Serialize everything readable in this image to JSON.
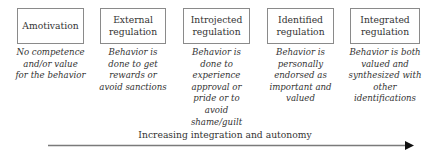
{
  "diagram": {
    "stages": [
      {
        "title_lines": [
          "Amotivation"
        ],
        "description_lines": [
          "No competence",
          "and/or value",
          "for the behavior"
        ]
      },
      {
        "title_lines": [
          "External",
          "regulation"
        ],
        "description_lines": [
          "Behavior is",
          "done to get",
          "rewards or",
          "avoid sanctions"
        ]
      },
      {
        "title_lines": [
          "Introjected",
          "regulation"
        ],
        "description_lines": [
          "Behavior is",
          "done to",
          "experience",
          "approval or",
          "pride or to",
          "avoid",
          "shame/guilt"
        ]
      },
      {
        "title_lines": [
          "Identified",
          "regulation"
        ],
        "description_lines": [
          "Behavior is",
          "personally",
          "endorsed as",
          "important and",
          "valued"
        ]
      },
      {
        "title_lines": [
          "Integrated",
          "regulation"
        ],
        "description_lines": [
          "Behavior is both",
          "valued and",
          "synthesized with",
          "other",
          "identifications"
        ]
      }
    ],
    "axis": {
      "label": "Increasing integration and autonomy",
      "direction": "left-to-right"
    },
    "colors": {
      "box_border": "#8a8a8a",
      "text": "#333333",
      "arrow_line": "#7a7a7a",
      "arrow_head": "#111111"
    }
  }
}
